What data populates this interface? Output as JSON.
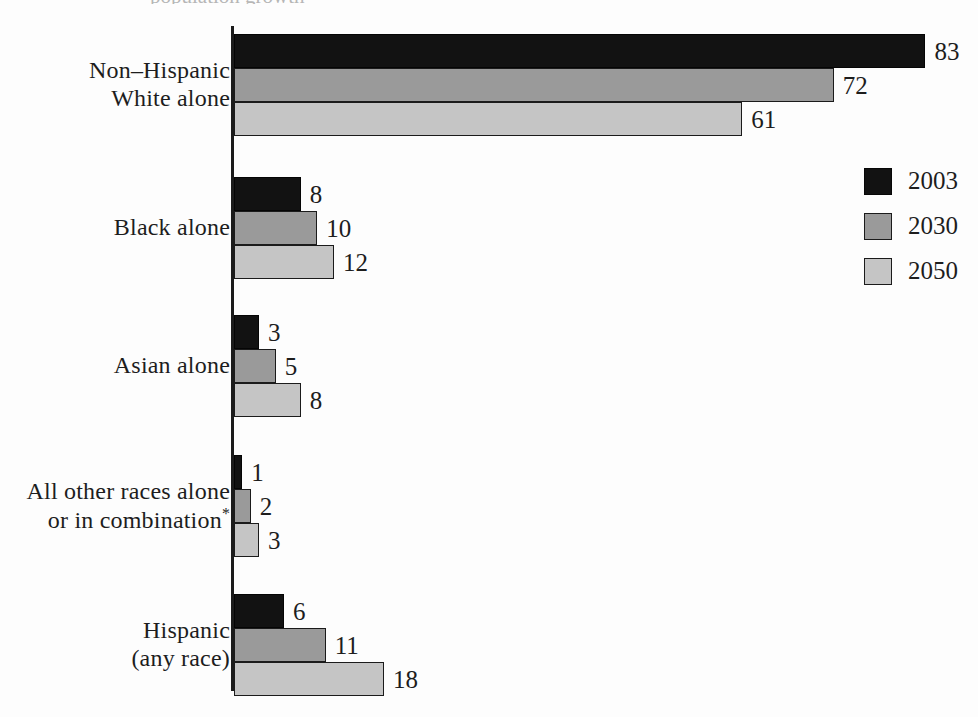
{
  "clipped_title": "population growth",
  "chart_data": {
    "type": "bar",
    "orientation": "horizontal",
    "title": "",
    "subtitle": "",
    "xlabel": "",
    "ylabel": "",
    "xlim": [
      0,
      100
    ],
    "grid": false,
    "legend_position": "right",
    "value_labels": true,
    "units": "percent",
    "categories": [
      "Non–Hispanic\nWhite alone",
      "Black alone",
      "Asian alone",
      "All other races alone\nor in combination*",
      "Hispanic\n(any race)"
    ],
    "series": [
      {
        "name": "2003",
        "color": "#121212",
        "values": [
          83,
          8,
          3,
          1,
          6
        ]
      },
      {
        "name": "2030",
        "color": "#9a9a9a",
        "values": [
          72,
          10,
          5,
          2,
          11
        ]
      },
      {
        "name": "2050",
        "color": "#c5c5c5",
        "values": [
          61,
          12,
          8,
          3,
          18
        ]
      }
    ],
    "annotations": [
      "*"
    ]
  },
  "legend": {
    "items": [
      {
        "label": "2003"
      },
      {
        "label": "2030"
      },
      {
        "label": "2050"
      }
    ]
  },
  "colors": {
    "series_2003": "#121212",
    "series_2030": "#9a9a9a",
    "series_2050": "#c5c5c5",
    "axis": "#1b1b1b",
    "text": "#1d1d1d",
    "background": "#fdfdfd"
  }
}
